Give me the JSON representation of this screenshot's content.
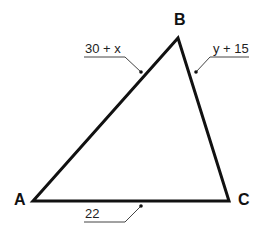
{
  "figure": {
    "type": "triangle",
    "vertices": {
      "A": {
        "label": "A",
        "x": 33,
        "y": 201
      },
      "B": {
        "label": "B",
        "x": 178,
        "y": 38
      },
      "C": {
        "label": "C",
        "x": 229,
        "y": 201
      }
    },
    "sides": {
      "AB": {
        "label": "30 + x"
      },
      "BC": {
        "label": "y + 15"
      },
      "AC": {
        "label": "22"
      }
    },
    "colors": {
      "stroke": "#111111",
      "leader": "#444444",
      "background": "#ffffff"
    }
  }
}
